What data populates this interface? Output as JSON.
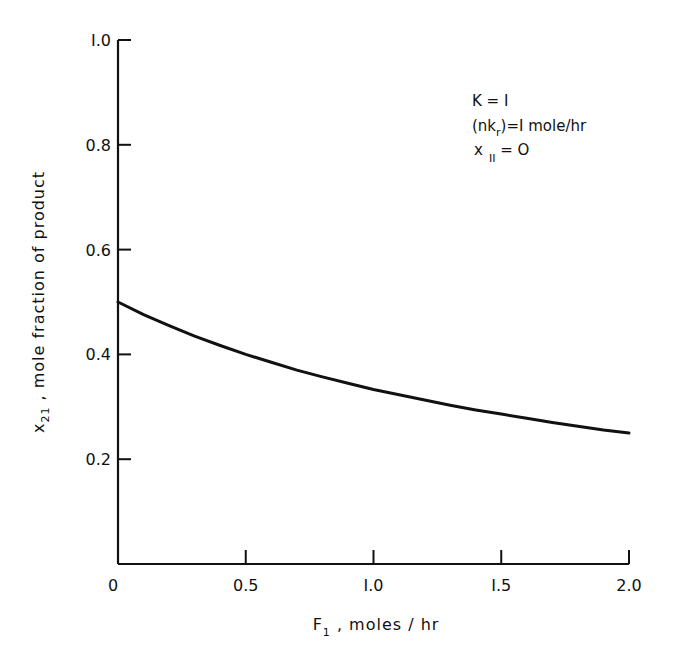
{
  "chart_data": {
    "type": "line",
    "title": "",
    "xlabel": "F1 , moles/hr",
    "xlabel_main": "F",
    "xlabel_sub": "1",
    "xlabel_rest": " , moles / hr",
    "ylabel": "x21 , mole fraction of product",
    "ylabel_main": "x",
    "ylabel_sub": "21",
    "ylabel_rest": " ,  mole  fraction  of  product",
    "xlim": [
      0,
      2.0
    ],
    "ylim": [
      0,
      1.0
    ],
    "x_ticks": [
      "0",
      "0.5",
      "1.0",
      "1.5",
      "2.0"
    ],
    "y_ticks": [
      "0.2",
      "0.4",
      "0.6",
      "0.8",
      "1.0"
    ],
    "grid": false,
    "legend": null,
    "annotations": [
      "K = 1",
      "(nk_r) = 1 mole/hr",
      "x_11 = 0"
    ],
    "series": [
      {
        "name": "x21",
        "x": [
          0,
          0.1,
          0.2,
          0.3,
          0.4,
          0.5,
          0.6,
          0.7,
          0.8,
          0.9,
          1.0,
          1.1,
          1.2,
          1.3,
          1.4,
          1.5,
          1.6,
          1.7,
          1.8,
          1.9,
          2.0
        ],
        "values": [
          0.5,
          0.476,
          0.455,
          0.435,
          0.417,
          0.4,
          0.385,
          0.37,
          0.357,
          0.345,
          0.333,
          0.323,
          0.313,
          0.303,
          0.294,
          0.286,
          0.278,
          0.27,
          0.263,
          0.256,
          0.25
        ]
      }
    ]
  },
  "annotations": {
    "k_line": "K = I",
    "nkr_open": "(nk",
    "nkr_sub": "r",
    "nkr_close": ")=I mole/hr",
    "x11_main": "x",
    "x11_sub": "II",
    "x11_rest": "  =  O"
  }
}
